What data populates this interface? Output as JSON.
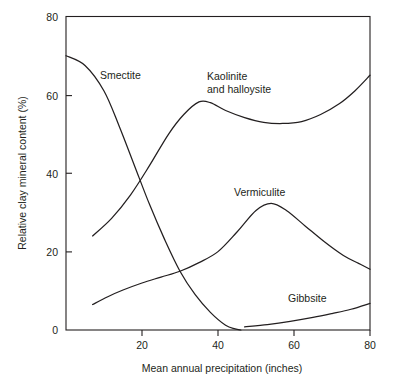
{
  "chart_data": {
    "type": "line",
    "title": "",
    "xlabel": "Mean annual precipitation (inches)",
    "ylabel": "Relative clay mineral content (%)",
    "xlim": [
      0,
      80
    ],
    "ylim": [
      0,
      80
    ],
    "xticks": [
      0,
      20,
      40,
      60,
      80
    ],
    "xtick_labels": [
      "",
      "20",
      "40",
      "60",
      "80"
    ],
    "yticks": [
      0,
      20,
      40,
      60,
      80
    ],
    "ytick_labels": [
      "0",
      "20",
      "40",
      "60",
      "80"
    ],
    "grid": false,
    "legend_position": "inline-annotations",
    "series": [
      {
        "name": "Smectite",
        "label": "Smectite",
        "x": [
          0,
          5,
          10,
          14,
          18,
          22,
          26,
          30,
          34,
          38,
          42,
          44.5,
          46
        ],
        "y": [
          70,
          67.5,
          61,
          52,
          42,
          32,
          23,
          15,
          9,
          4.5,
          1.2,
          0.3,
          0
        ]
      },
      {
        "name": "Kaolinite and halloysite",
        "label": "Kaolinite\nand halloysite",
        "label_line1": "Kaolinite",
        "label_line2": "and halloysite",
        "x": [
          7,
          12,
          17,
          22,
          27,
          31,
          35,
          38,
          42,
          47,
          52,
          57,
          62,
          67,
          72,
          76,
          80
        ],
        "y": [
          24,
          28.5,
          34.5,
          42,
          50,
          55,
          58.2,
          58,
          56,
          54.2,
          53,
          52.7,
          53.2,
          55,
          57.8,
          61,
          65
        ]
      },
      {
        "name": "Vermiculite",
        "label": "Vermiculite",
        "x": [
          7,
          11,
          15,
          20,
          25,
          30,
          35,
          40,
          45,
          50,
          54,
          58,
          63,
          68,
          73,
          77,
          80
        ],
        "y": [
          6.5,
          8.5,
          10.2,
          12,
          13.5,
          15,
          17.2,
          20,
          25,
          30.5,
          32.3,
          30.5,
          26.5,
          22.5,
          19,
          17,
          15.5
        ]
      },
      {
        "name": "Gibbsite",
        "label": "Gibbsite",
        "x": [
          47,
          53,
          59,
          65,
          70,
          75,
          80
        ],
        "y": [
          0.8,
          1.4,
          2.2,
          3.2,
          4.2,
          5.3,
          6.8
        ]
      }
    ]
  },
  "annotations": {
    "smectite": {
      "text": "Smectite",
      "x": 100,
      "y": 79
    },
    "kaolinite_line1": {
      "text": "Kaolinite",
      "x": 207,
      "y": 80
    },
    "kaolinite_line2": {
      "text": "and halloysite",
      "x": 207,
      "y": 93
    },
    "vermiculite": {
      "text": "Vermiculite",
      "x": 234,
      "y": 196
    },
    "gibbsite": {
      "text": "Gibbsite",
      "x": 288,
      "y": 302
    }
  },
  "axes": {
    "x_title": "Mean annual precipitation (inches)",
    "y_title": "Relative clay mineral content (%)",
    "x_tick_20": "20",
    "x_tick_40": "40",
    "x_tick_60": "60",
    "x_tick_80": "80",
    "y_tick_0": "0",
    "y_tick_20": "20",
    "y_tick_40": "40",
    "y_tick_60": "60",
    "y_tick_80": "80"
  },
  "colors": {
    "ink": "#231f20",
    "background": "#ffffff"
  }
}
